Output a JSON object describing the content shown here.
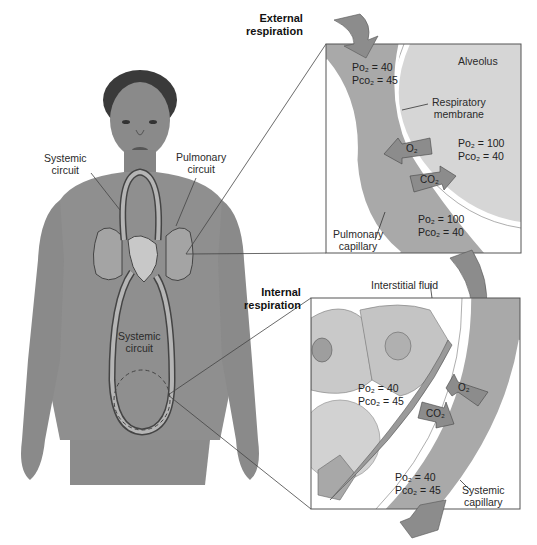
{
  "figure": {
    "body_labels": {
      "systemic_circuit_upper": [
        "Systemic",
        "circuit"
      ],
      "pulmonary_circuit": [
        "Pulmonary",
        "circuit"
      ],
      "systemic_circuit_lower": [
        "Systemic",
        "circuit"
      ]
    },
    "external_respiration": {
      "title": [
        "External",
        "respiration"
      ],
      "alveolus_label": "Alveolus",
      "membrane_label": [
        "Respiratory",
        "membrane"
      ],
      "capillary_label": [
        "Pulmonary",
        "capillary"
      ],
      "blood_in": {
        "po2": "Po₂ = 40",
        "pco2": "Pco₂ = 45"
      },
      "alveolus_values": {
        "po2": "Po₂ = 100",
        "pco2": "Pco₂ = 40"
      },
      "blood_out": {
        "po2": "Po₂ = 100",
        "pco2": "Pco₂ = 40"
      },
      "arrow_o2": "O₂",
      "arrow_co2": "CO₂"
    },
    "internal_respiration": {
      "title": [
        "Internal",
        "respiration"
      ],
      "fluid_label": "Interstitial fluid",
      "capillary_label": [
        "Systemic",
        "capillary"
      ],
      "tissue_values": {
        "po2": "Po₂ = 40",
        "pco2": "Pco₂ = 45"
      },
      "blood_out": {
        "po2": "Po₂ = 40",
        "pco2": "Pco₂ = 45"
      },
      "arrow_o2": "O₂",
      "arrow_co2": "CO₂"
    },
    "colors": {
      "capillary": "#a9a9a9",
      "alveolus": "#d6d6d6",
      "arrow": "#8c8c8c",
      "skin": "#8f8f8f",
      "frame": "#555555"
    }
  }
}
